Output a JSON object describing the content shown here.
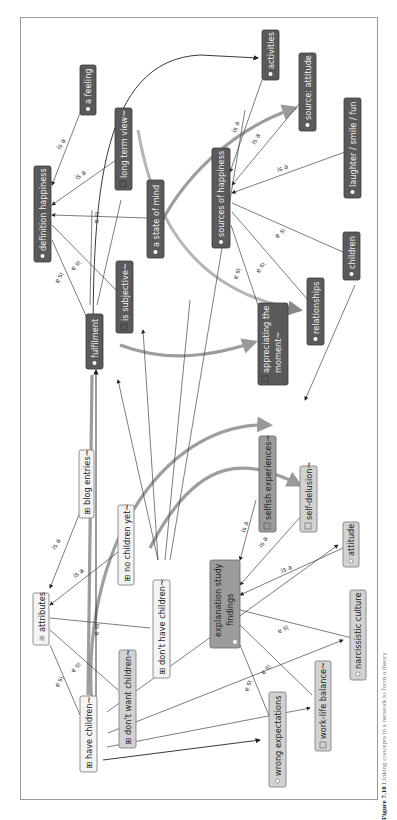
{
  "figure": {
    "orientation": "rotated-90",
    "caption_label": "Figure 7.10",
    "caption_text": "Linking concepts in a network to form a theory"
  },
  "nodes": {
    "a_feeling": {
      "label": "a feeling",
      "icon": "bullet-icon"
    },
    "definition_happiness": {
      "label": "definition happiness",
      "icon": "bullet-icon"
    },
    "long_term_view": {
      "label": "long term view~",
      "icon": "memo-icon"
    },
    "a_state_of_mind": {
      "label": "a state of mind",
      "icon": "bullet-icon"
    },
    "is_subjective": {
      "label": "is subjective~",
      "icon": "memo-icon"
    },
    "fulfilment": {
      "label": "fulfilment",
      "icon": "bullet-icon"
    },
    "activities": {
      "label": "activities",
      "icon": "bullet-icon"
    },
    "source_attitude": {
      "label": "source: attitude",
      "icon": "bullet-icon"
    },
    "laughter": {
      "label": "laughter / smile / fun",
      "icon": "bullet-icon"
    },
    "sources_of_happiness": {
      "label": "sources of happiness",
      "icon": "bullet-icon"
    },
    "children": {
      "label": "children",
      "icon": "bullet-icon"
    },
    "relationships": {
      "label": "relationships",
      "icon": "bullet-icon"
    },
    "appreciating_the_moment_1": {
      "label": "appreciating the",
      "icon": "memo-icon"
    },
    "appreciating_the_moment_2": {
      "label": "moment~"
    },
    "blog_entries": {
      "label": "blog entries~",
      "icon": "document-group-icon"
    },
    "no_children_yet": {
      "label": "no children yet~",
      "icon": "document-group-icon"
    },
    "attributes": {
      "label": "attributes",
      "icon": "gear-icon"
    },
    "dont_have_children": {
      "label": "don't have children~",
      "icon": "document-group-icon"
    },
    "dont_want_children": {
      "label": "don't want children~",
      "icon": "document-group-icon"
    },
    "have_children": {
      "label": "have children~",
      "icon": "document-group-icon"
    },
    "selfish_experiences": {
      "label": "selfish experiences~",
      "icon": "memo-icon"
    },
    "self_delusion": {
      "label": "self-delusion~",
      "icon": "memo-icon"
    },
    "attitude": {
      "label": "attitude",
      "icon": "bullet-icon"
    },
    "explanation_study_findings_1": {
      "label": "explanation study",
      "icon": "bullet-icon"
    },
    "explanation_study_findings_2": {
      "label": "findings"
    },
    "narcissistic_culture": {
      "label": "narcissistic culture",
      "icon": "bullet-icon"
    },
    "work_life_balance": {
      "label": "work-life balance~",
      "icon": "memo-icon"
    },
    "wrong_expectations": {
      "label": "wrong expectations",
      "icon": "bullet-icon"
    }
  },
  "edge_labels": {
    "is_a": "is a"
  },
  "colors": {
    "dark_node": "#5a5a5a",
    "light_node": "#d2d2d2",
    "mid_node": "#9c9c9c",
    "edge": "#222222",
    "frame": "#9a9a9a"
  }
}
